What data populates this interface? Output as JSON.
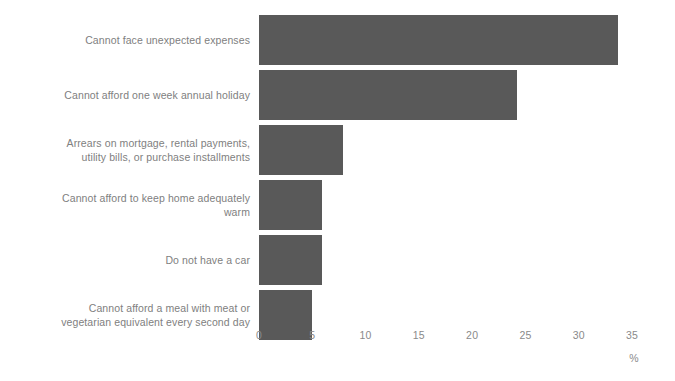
{
  "chart_data": {
    "type": "bar",
    "orientation": "horizontal",
    "title": "",
    "subtitle": "",
    "xlabel": "%",
    "ylabel": "",
    "xlim": [
      0,
      35
    ],
    "xticks": [
      0,
      5,
      10,
      15,
      20,
      25,
      30,
      35
    ],
    "xtick_labels": [
      "0",
      "5",
      "10",
      "15",
      "20",
      "25",
      "30",
      "35"
    ],
    "grid": false,
    "legend": false,
    "legend_position": "none",
    "bar_color": "#595959",
    "label_color": "#808080",
    "tick_color": "#8a8a8a",
    "background": "#ffffff",
    "categories": [
      "Cannot face unexpected expenses",
      "Cannot afford one week annual holiday",
      "Arrears on mortgage, rental payments,\nutility bills, or purchase installments",
      "Cannot afford to keep home adequately\nwarm",
      "Do not have a car",
      "Cannot afford a meal with meat or\nvegetarian equivalent every second day"
    ],
    "values": [
      33.7,
      24.2,
      7.9,
      5.9,
      5.9,
      5.0
    ]
  }
}
